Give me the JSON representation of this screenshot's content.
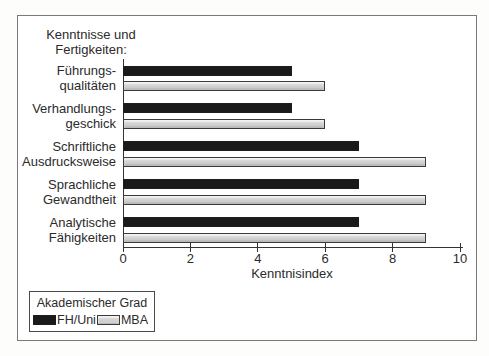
{
  "chart_data": {
    "type": "bar",
    "orientation": "horizontal",
    "title": "Kenntnisse und Fertigkeiten:",
    "title_lines": [
      "Kenntnisse und",
      "Fertigkeiten:"
    ],
    "categories": [
      "Führungsqualitäten",
      "Verhandlungsgeschick",
      "Schriftliche Ausdrucksweise",
      "Sprachliche Gewandtheit",
      "Analytische Fähigkeiten"
    ],
    "category_lines": [
      [
        "Führungs-",
        "qualitäten"
      ],
      [
        "Verhandlungs-",
        "geschick"
      ],
      [
        "Schriftliche",
        "Ausdrucksweise"
      ],
      [
        "Sprachliche",
        "Gewandtheit"
      ],
      [
        "Analytische",
        "Fähigkeiten"
      ]
    ],
    "series": [
      {
        "name": "FH/Uni",
        "color": "#1a1a1a",
        "values": [
          5,
          5,
          7,
          7,
          7
        ]
      },
      {
        "name": "MBA",
        "color": "#d2d2d2",
        "values": [
          6,
          6,
          9,
          9,
          9
        ]
      }
    ],
    "xlabel": "Kenntnisindex",
    "xlim": [
      0,
      10
    ],
    "x_ticks": [
      0,
      2,
      4,
      6,
      8,
      10
    ],
    "grid": false,
    "legend_title": "Akademischer Grad",
    "legend_position": "bottom-left",
    "frame_border_color": "#7a7a7a",
    "axis_color": "#333333",
    "text_color": "#2b2b2b"
  }
}
